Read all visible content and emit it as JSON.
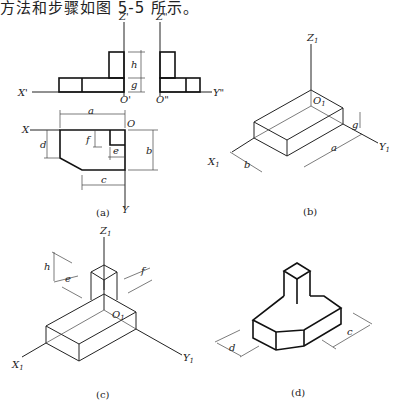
{
  "intro_text": "方法和步骤如图 5-5 所示。",
  "panels": {
    "a": {
      "caption": "(a)",
      "axes": {
        "z": "Z'",
        "z2": "Z\"",
        "x": "X'",
        "o": "O'",
        "o2": "O\"",
        "y": "Y\"",
        "x_top": "X",
        "o_top": "O",
        "y_bottom": "Y"
      },
      "dims": {
        "h": "h",
        "g": "g",
        "a": "a",
        "b": "b",
        "c": "c",
        "d": "d",
        "e": "e",
        "f": "f"
      }
    },
    "b": {
      "caption": "(b)",
      "axes": {
        "z": "Z",
        "x": "X",
        "y": "Y",
        "o": "O",
        "sub": "1"
      },
      "dims": {
        "a": "a",
        "b": "b",
        "g": "g"
      }
    },
    "c": {
      "caption": "(c)",
      "axes": {
        "z": "Z",
        "x": "X",
        "y": "Y",
        "o": "O",
        "sub": "1"
      },
      "dims": {
        "h": "h",
        "e": "e",
        "f": "f"
      }
    },
    "d": {
      "caption": "(d)",
      "dims": {
        "c": "c",
        "d": "d"
      }
    }
  }
}
